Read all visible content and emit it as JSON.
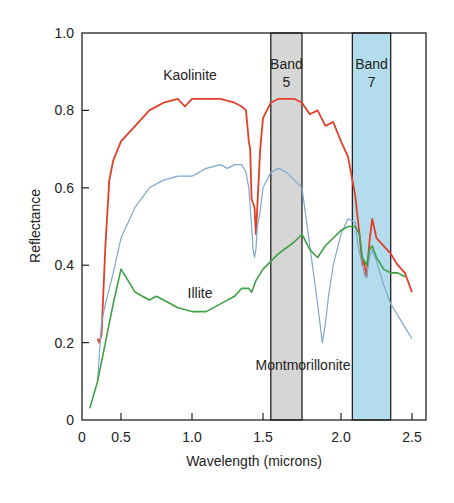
{
  "chart_data": {
    "type": "line",
    "title": "",
    "xlabel": "Wavelength (microns)",
    "ylabel": "Reflectance",
    "xlim": [
      0,
      2.6
    ],
    "ylim": [
      0,
      1.0
    ],
    "x_ticks": [
      "0",
      "0.5",
      "1.0",
      "1.5",
      "2.0",
      "2.5"
    ],
    "y_ticks": [
      "0",
      "0.2",
      "0.4",
      "0.6",
      "0.8",
      "1.0"
    ],
    "grid": false,
    "bands": [
      {
        "name": "Band 5",
        "label_line1": "Band",
        "label_line2": "5",
        "x_start": 1.55,
        "x_end": 1.75,
        "color": "#d6d6d6"
      },
      {
        "name": "Band 7",
        "label_line1": "Band",
        "label_line2": "7",
        "x_start": 2.08,
        "x_end": 2.35,
        "color": "#b3dcec"
      }
    ],
    "series": [
      {
        "name": "Kaolinite",
        "color": "#e0402a",
        "x": [
          0.2,
          0.22,
          0.25,
          0.3,
          0.35,
          0.4,
          0.5,
          0.6,
          0.7,
          0.8,
          0.9,
          0.95,
          1.0,
          1.05,
          1.1,
          1.2,
          1.3,
          1.35,
          1.38,
          1.4,
          1.41,
          1.42,
          1.43,
          1.44,
          1.45,
          1.46,
          1.48,
          1.5,
          1.55,
          1.6,
          1.7,
          1.75,
          1.8,
          1.85,
          1.9,
          1.95,
          2.0,
          2.05,
          2.1,
          2.13,
          2.15,
          2.16,
          2.18,
          2.2,
          2.22,
          2.25,
          2.3,
          2.35,
          2.4,
          2.45,
          2.5
        ],
        "y": [
          0.21,
          0.2,
          0.22,
          0.45,
          0.62,
          0.67,
          0.72,
          0.76,
          0.8,
          0.82,
          0.83,
          0.81,
          0.83,
          0.83,
          0.83,
          0.83,
          0.82,
          0.81,
          0.8,
          0.72,
          0.7,
          0.57,
          0.56,
          0.55,
          0.48,
          0.55,
          0.7,
          0.78,
          0.82,
          0.83,
          0.83,
          0.82,
          0.79,
          0.8,
          0.76,
          0.77,
          0.72,
          0.68,
          0.58,
          0.48,
          0.4,
          0.41,
          0.37,
          0.46,
          0.52,
          0.47,
          0.45,
          0.43,
          0.4,
          0.38,
          0.33
        ]
      },
      {
        "name": "Montmorillonite",
        "color": "#7fa7cf",
        "x": [
          0.2,
          0.25,
          0.3,
          0.4,
          0.5,
          0.6,
          0.7,
          0.8,
          0.9,
          1.0,
          1.1,
          1.2,
          1.25,
          1.3,
          1.35,
          1.38,
          1.4,
          1.42,
          1.43,
          1.44,
          1.45,
          1.46,
          1.48,
          1.5,
          1.55,
          1.6,
          1.65,
          1.7,
          1.75,
          1.8,
          1.85,
          1.88,
          1.9,
          1.92,
          1.95,
          2.0,
          2.05,
          2.1,
          2.12,
          2.15,
          2.17,
          2.18,
          2.2,
          2.22,
          2.25,
          2.3,
          2.35,
          2.4,
          2.45,
          2.5
        ],
        "y": [
          0.1,
          0.25,
          0.3,
          0.38,
          0.47,
          0.55,
          0.6,
          0.62,
          0.63,
          0.63,
          0.65,
          0.66,
          0.65,
          0.66,
          0.66,
          0.64,
          0.6,
          0.5,
          0.44,
          0.42,
          0.44,
          0.5,
          0.54,
          0.6,
          0.64,
          0.65,
          0.64,
          0.62,
          0.6,
          0.45,
          0.3,
          0.2,
          0.25,
          0.32,
          0.4,
          0.48,
          0.52,
          0.51,
          0.45,
          0.4,
          0.37,
          0.37,
          0.42,
          0.44,
          0.41,
          0.35,
          0.3,
          0.27,
          0.24,
          0.21
        ]
      },
      {
        "name": "Illite",
        "color": "#3fa044",
        "x": [
          0.1,
          0.2,
          0.3,
          0.4,
          0.5,
          0.55,
          0.6,
          0.7,
          0.75,
          0.8,
          0.9,
          1.0,
          1.1,
          1.2,
          1.3,
          1.35,
          1.4,
          1.42,
          1.45,
          1.5,
          1.6,
          1.7,
          1.75,
          1.8,
          1.85,
          1.9,
          2.0,
          2.05,
          2.1,
          2.13,
          2.15,
          2.18,
          2.2,
          2.22,
          2.25,
          2.3,
          2.35,
          2.4,
          2.45
        ],
        "y": [
          0.03,
          0.1,
          0.2,
          0.3,
          0.39,
          0.36,
          0.33,
          0.31,
          0.32,
          0.31,
          0.29,
          0.28,
          0.28,
          0.3,
          0.32,
          0.34,
          0.34,
          0.33,
          0.36,
          0.39,
          0.43,
          0.46,
          0.48,
          0.44,
          0.42,
          0.45,
          0.49,
          0.5,
          0.5,
          0.48,
          0.42,
          0.4,
          0.44,
          0.45,
          0.42,
          0.39,
          0.38,
          0.38,
          0.37
        ]
      }
    ],
    "annotations": [
      {
        "text": "Kaolinite",
        "x": 1.0,
        "y": 0.87
      },
      {
        "text": "Illite",
        "x": 1.15,
        "y": 0.32
      },
      {
        "text": "Montmorillonite",
        "x": 2.0,
        "y": 0.17
      }
    ]
  }
}
